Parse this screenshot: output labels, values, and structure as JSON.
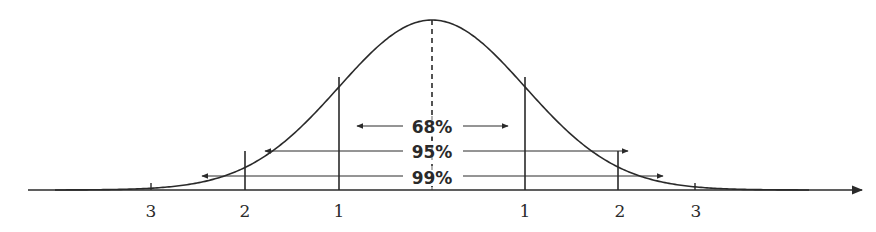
{
  "diagram": {
    "title": "",
    "type": "normal distribution empirical rule",
    "curve": {
      "color": "#2a2a2a",
      "center_x": 432,
      "peak_y": 20,
      "baseline_y": 190,
      "sigma_px": 93
    },
    "mean_line": {
      "style": "dashed"
    },
    "intervals": [
      {
        "label": "68%",
        "sigma": 1,
        "y": 126,
        "x1": 357,
        "x2": 508
      },
      {
        "label": "95%",
        "sigma": 2,
        "y": 151,
        "x1": 265,
        "x2": 628
      },
      {
        "label": "99%",
        "sigma": 3,
        "y": 176,
        "x1": 202,
        "x2": 663
      }
    ],
    "tick_labels": {
      "left_3": "3",
      "left_2": "2",
      "left_1": "1",
      "right_1": "1",
      "right_2": "2",
      "right_3": "3"
    }
  }
}
